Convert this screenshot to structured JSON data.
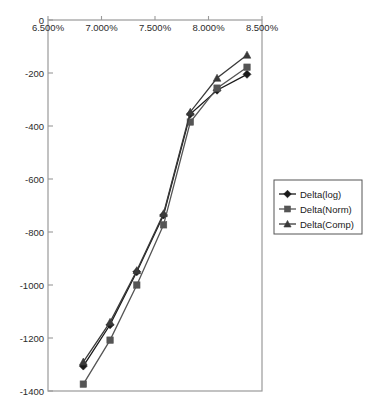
{
  "chart_data": {
    "type": "line",
    "title": "",
    "xlabel": "",
    "ylabel": "",
    "grid": false,
    "legend_position": "right",
    "xlim": [
      6.5,
      8.5
    ],
    "ylim": [
      -1400,
      0
    ],
    "x_axis_position": "top",
    "xtick_labels": [
      "6.500%",
      "7.000%",
      "7.500%",
      "8.000%",
      "8.500%"
    ],
    "xtick_values": [
      6.5,
      7.0,
      7.5,
      8.0,
      8.5
    ],
    "ytick_labels": [
      "0",
      "-200",
      "-400",
      "-600",
      "-800",
      "-1000",
      "-1200",
      "-1400"
    ],
    "ytick_values": [
      0,
      -200,
      -400,
      -600,
      -800,
      -1000,
      -1200,
      -1400
    ],
    "x": [
      6.83,
      7.08,
      7.33,
      7.58,
      7.83,
      8.08,
      8.36
    ],
    "series": [
      {
        "name": "Delta(log)",
        "marker": "diamond",
        "color": "#1a1a1a",
        "values": [
          -1306,
          -1150,
          -950,
          -736,
          -355,
          -265,
          -205
        ]
      },
      {
        "name": "Delta(Norm)",
        "marker": "square",
        "color": "#555555",
        "values": [
          -1374,
          -1208,
          -1000,
          -773,
          -385,
          -257,
          -178
        ]
      },
      {
        "name": "Delta(Comp)",
        "marker": "triangle",
        "color": "#3a3a3a",
        "values": [
          -1290,
          -1140,
          -945,
          -730,
          -347,
          -219,
          -132
        ]
      }
    ]
  },
  "legend": {
    "entries": [
      {
        "label": "Delta(log)",
        "marker": "diamond-marker"
      },
      {
        "label": "Delta(Norm)",
        "marker": "square-marker"
      },
      {
        "label": "Delta(Comp)",
        "marker": "triangle-marker"
      }
    ]
  },
  "colors": {
    "axis": "#9a9a9a",
    "text": "#2b2b2b",
    "plot_background": "#ffffff",
    "legend_border": "#555555"
  }
}
